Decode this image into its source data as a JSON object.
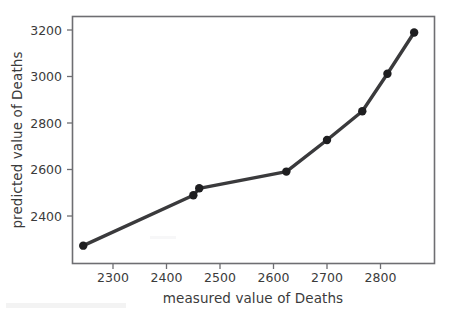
{
  "chart_data": {
    "type": "line",
    "title": "",
    "xlabel": "measured value of Deaths",
    "ylabel": "predicted value of Deaths",
    "x": [
      2255,
      2461,
      2472,
      2635,
      2711,
      2777,
      2824,
      2874
    ],
    "values": [
      2270,
      2487,
      2517,
      2589,
      2725,
      2849,
      3010,
      3188
    ],
    "series": [
      {
        "name": "predicted vs measured",
        "x": [
          2255,
          2461,
          2472,
          2635,
          2711,
          2777,
          2824,
          2874
        ],
        "values": [
          2270,
          2487,
          2517,
          2589,
          2725,
          2849,
          3010,
          3188
        ]
      }
    ],
    "xticks": [
      2300,
      2400,
      2500,
      2600,
      2700,
      2800
    ],
    "yticks": [
      2400,
      2600,
      2800,
      3000,
      3200
    ],
    "xtick_labels": [
      "2300",
      "2400",
      "2500",
      "2600",
      "2700",
      "2800"
    ],
    "ytick_labels": [
      "2400",
      "2600",
      "2800",
      "3000",
      "3200"
    ],
    "xlim": [
      2234,
      2913
    ],
    "ylim": [
      2191,
      3259
    ],
    "grid": false,
    "legend": false,
    "legend_position": "none",
    "marker": "circle",
    "line_color": "#3a3a3c",
    "marker_color": "#1e1e20",
    "axis_color": "#6e6e72",
    "text_color": "#3b3b3b",
    "background_color": "#ffffff"
  }
}
